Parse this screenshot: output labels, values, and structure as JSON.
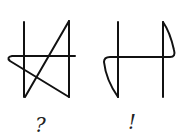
{
  "figures": [
    {
      "id": "left-figure",
      "label": "?",
      "description": "two vertical strokes crossed by a horizontal stroke with diagonal zigzag"
    },
    {
      "id": "right-figure",
      "label": "!",
      "description": "two vertical strokes crossed by a horizontal stroke with curved hooks"
    }
  ],
  "colors": {
    "stroke": "#111111",
    "background": "#ffffff"
  }
}
